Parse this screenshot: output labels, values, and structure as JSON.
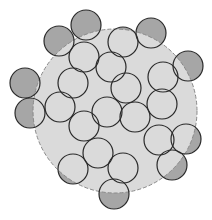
{
  "diagram": {
    "title": "",
    "width": 212,
    "height": 220,
    "colors": {
      "background": "#ffffff",
      "region_fill": "#dadada",
      "region_stroke": "#8a8a8a",
      "circle_fill": "#dadada",
      "circle_outside_fill": "#a6a6a6",
      "circle_stroke": "#2a2a2a"
    },
    "boundary": {
      "cx": 115,
      "cy": 111,
      "r": 82,
      "dashed": true
    },
    "circle_radius": 15,
    "circles": [
      {
        "cx": 86,
        "cy": 25
      },
      {
        "cx": 59,
        "cy": 41
      },
      {
        "cx": 151,
        "cy": 33
      },
      {
        "cx": 123,
        "cy": 42
      },
      {
        "cx": 84,
        "cy": 57
      },
      {
        "cx": 111,
        "cy": 67
      },
      {
        "cx": 188,
        "cy": 66
      },
      {
        "cx": 163,
        "cy": 77
      },
      {
        "cx": 25,
        "cy": 83
      },
      {
        "cx": 73,
        "cy": 83
      },
      {
        "cx": 126,
        "cy": 88
      },
      {
        "cx": 60,
        "cy": 107
      },
      {
        "cx": 30,
        "cy": 113
      },
      {
        "cx": 107,
        "cy": 112
      },
      {
        "cx": 162,
        "cy": 104
      },
      {
        "cx": 135,
        "cy": 117
      },
      {
        "cx": 84,
        "cy": 126
      },
      {
        "cx": 159,
        "cy": 140
      },
      {
        "cx": 186,
        "cy": 139
      },
      {
        "cx": 98,
        "cy": 153
      },
      {
        "cx": 172,
        "cy": 165
      },
      {
        "cx": 73,
        "cy": 169
      },
      {
        "cx": 123,
        "cy": 168
      },
      {
        "cx": 114,
        "cy": 194
      }
    ]
  }
}
